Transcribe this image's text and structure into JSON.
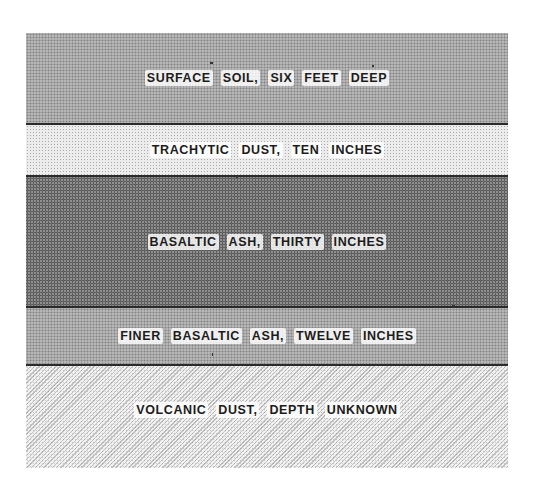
{
  "diagram": {
    "type": "stratigraphic-section",
    "layers": [
      {
        "label": "SURFACE SOIL, SIX FEET DEEP",
        "words": [
          "SURFACE",
          "SOIL,",
          "SIX",
          "FEET",
          "DEEP"
        ],
        "texture": "medium-dot"
      },
      {
        "label": "TRACHYTIC DUST, TEN INCHES",
        "words": [
          "TRACHYTIC",
          "DUST,",
          "TEN",
          "INCHES"
        ],
        "texture": "light-dot"
      },
      {
        "label": "BASALTIC ASH, THIRTY INCHES",
        "words": [
          "BASALTIC",
          "ASH,",
          "THIRTY",
          "INCHES"
        ],
        "texture": "dense-dot"
      },
      {
        "label": "FINER BASALTIC ASH, TWELVE INCHES",
        "words": [
          "FINER",
          "BASALTIC",
          "ASH,",
          "TWELVE",
          "INCHES"
        ],
        "texture": "medium-dot"
      },
      {
        "label": "VOLCANIC DUST, DEPTH UNKNOWN",
        "words": [
          "VOLCANIC",
          "DUST,",
          "DEPTH",
          "UNKNOWN"
        ],
        "texture": "light-diagonal"
      }
    ]
  }
}
